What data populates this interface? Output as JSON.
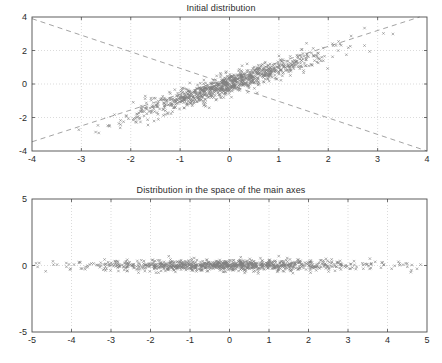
{
  "figure": {
    "background_color": "#ffffff",
    "marker_color": "#808080",
    "axis_color": "#4d4d4d",
    "grid_color": "#b3b3b3",
    "dashline_color": "#999999"
  },
  "chart_data": [
    {
      "type": "scatter",
      "panel": "top",
      "title": "Initial distribution",
      "xlabel": "",
      "ylabel": "",
      "xlim": [
        -4,
        4
      ],
      "ylim": [
        -4,
        4
      ],
      "xticks": [
        -4,
        -3,
        -2,
        -1,
        0,
        1,
        2,
        3,
        4
      ],
      "yticks": [
        -4,
        -2,
        0,
        2,
        4
      ],
      "xticklabels": [
        "-4",
        "-3",
        "-2",
        "-1",
        "0",
        "1",
        "2",
        "3",
        "4"
      ],
      "yticklabels": [
        "-4",
        "-2",
        "0",
        "2",
        "4"
      ],
      "grid": true,
      "grid_style": "dotted",
      "legend": null,
      "marker": "x",
      "marker_color": "#808080",
      "n_points": 1000,
      "description": "Elongated correlated Gaussian cloud along the +45 degree direction, mean approximately (0,0), spread roughly 1.3 along the principal axis and 0.25 across it, correlation about 0.97.",
      "cloud": {
        "mean": [
          0,
          0
        ],
        "angle_deg": 45,
        "sigma_major": 1.3,
        "sigma_minor": 0.22
      },
      "annotations": [
        {
          "type": "dashed-line",
          "name": "principal-axis-1",
          "from": [
            -4,
            -3.45
          ],
          "to": [
            3.85,
            4.0
          ],
          "style": "dashed",
          "color": "#999999"
        },
        {
          "type": "dashed-line",
          "name": "principal-axis-2",
          "from": [
            -4,
            3.9
          ],
          "to": [
            4.0,
            -4.0
          ],
          "style": "dashed",
          "color": "#999999"
        }
      ]
    },
    {
      "type": "scatter",
      "panel": "bottom",
      "title": "Distribution in the space of the main axes",
      "xlabel": "",
      "ylabel": "",
      "xlim": [
        -5,
        5
      ],
      "ylim": [
        -5,
        5
      ],
      "xticks": [
        -5,
        -4,
        -3,
        -2,
        -1,
        0,
        1,
        2,
        3,
        4,
        5
      ],
      "yticks": [
        -5,
        0,
        5
      ],
      "xticklabels": [
        "-5",
        "-4",
        "-3",
        "-2",
        "-1",
        "0",
        "1",
        "2",
        "3",
        "4",
        "5"
      ],
      "yticklabels": [
        "-5",
        "0",
        "5"
      ],
      "grid": true,
      "grid_style": "dotted",
      "legend": null,
      "marker": "x",
      "marker_color": "#808080",
      "n_points": 1000,
      "description": "Same cloud rotated into the principal-axis frame: a horizontal band centred on y=0, extending from about x=-4.3 to x=+4.7, with vertical spread of roughly 0.25.",
      "cloud": {
        "mean": [
          0,
          0
        ],
        "angle_deg": 0,
        "sigma_major": 1.85,
        "sigma_minor": 0.22
      },
      "annotations": []
    }
  ]
}
